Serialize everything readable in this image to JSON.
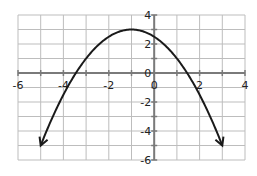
{
  "chart_data": {
    "type": "line",
    "title": "",
    "xlabel": "",
    "ylabel": "",
    "xlim": [
      -6,
      4
    ],
    "ylim": [
      -6,
      4
    ],
    "grid": true,
    "x_ticks": [
      -6,
      -4,
      -2,
      0,
      2,
      4
    ],
    "y_ticks": [
      4,
      2,
      0,
      -2,
      -4,
      -6
    ],
    "x_tick_labels": [
      "-6",
      "-4",
      "-2",
      "0",
      "2",
      "4"
    ],
    "y_tick_labels": [
      "4",
      "2",
      "0",
      "-2",
      "-4",
      "-6"
    ],
    "series": [
      {
        "name": "parabola",
        "equation": "y = -0.5(x+1)^2 + 3",
        "vertex": [
          -1,
          3
        ],
        "x_intercepts": [
          -3.45,
          1.45
        ],
        "y_intercept": 2.5,
        "endpoints_arrows": [
          [
            -5,
            -5
          ],
          [
            3,
            -5
          ]
        ],
        "x": [
          -5,
          -4,
          -3,
          -2,
          -1,
          0,
          1,
          2,
          3
        ],
        "values": [
          -5,
          -1.5,
          1,
          2.5,
          3,
          2.5,
          1,
          -1.5,
          -5
        ]
      }
    ]
  }
}
